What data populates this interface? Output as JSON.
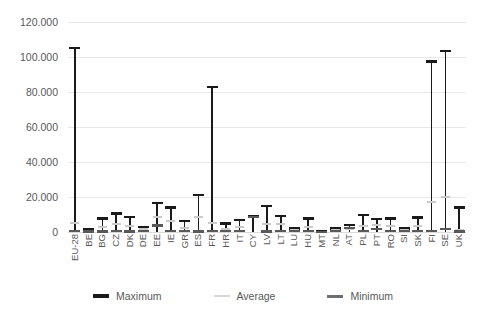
{
  "chart_data": {
    "type": "bar",
    "title": "",
    "subtitle": "",
    "xlabel": "",
    "ylabel": "",
    "ylim": [
      0,
      120000
    ],
    "ytick_values": [
      0,
      20000,
      40000,
      60000,
      80000,
      100000,
      120000
    ],
    "ytick_labels": [
      "0",
      "20.000",
      "40.000",
      "60.000",
      "80.000",
      "100.000",
      "120.000"
    ],
    "grid": true,
    "legend_position": "bottom",
    "categories": [
      "EU-28",
      "BE",
      "BG",
      "CZ",
      "DK",
      "DE",
      "EE",
      "IE",
      "GR",
      "ES",
      "FR",
      "HR",
      "IT",
      "CY",
      "LV",
      "LT",
      "LU",
      "HU",
      "MT",
      "NL",
      "AT",
      "PL",
      "PT",
      "RO",
      "SI",
      "SK",
      "FI",
      "SE",
      "UK"
    ],
    "series": [
      {
        "name": "Maximum",
        "color": "#1a1a1a",
        "values": [
          105000,
          1800,
          7800,
          10600,
          8700,
          3000,
          16500,
          14000,
          6200,
          21300,
          83000,
          4800,
          6800,
          8800,
          14700,
          9000,
          2100,
          7700,
          300,
          1900,
          4000,
          9600,
          7500,
          7800,
          2000,
          8300,
          97500,
          103500,
          14000
        ]
      },
      {
        "name": "Average",
        "color": "#c9c9c9",
        "values": [
          5200,
          700,
          3000,
          4600,
          3500,
          1500,
          8700,
          6200,
          2400,
          8300,
          5100,
          1600,
          2700,
          8600,
          4400,
          4700,
          900,
          3000,
          200,
          900,
          2000,
          3200,
          3800,
          3200,
          1100,
          3600,
          17000,
          20200,
          900
        ]
      },
      {
        "name": "Minimum",
        "color": "#6e6e6e",
        "values": [
          400,
          300,
          300,
          400,
          300,
          400,
          3700,
          400,
          400,
          300,
          400,
          400,
          400,
          8400,
          300,
          700,
          400,
          400,
          100,
          400,
          2200,
          400,
          1700,
          400,
          400,
          400,
          400,
          1800,
          300
        ]
      }
    ]
  },
  "legend": {
    "items": [
      {
        "label": "Maximum"
      },
      {
        "label": "Average"
      },
      {
        "label": "Minimum"
      }
    ]
  }
}
